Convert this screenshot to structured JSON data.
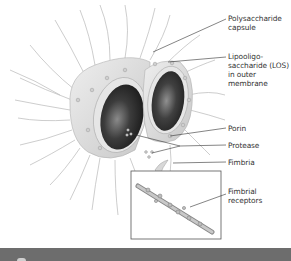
{
  "figure": {
    "labels": [
      {
        "id": "polysaccharide-capsule",
        "text": "Polysaccharide\ncapsule",
        "x": 228,
        "y": 14
      },
      {
        "id": "lipooligosaccharide",
        "text": "Lipooligo-\nsaccharide (LOS)\nin outer\nmembrane",
        "x": 228,
        "y": 52
      },
      {
        "id": "porin",
        "text": "Porin",
        "x": 228,
        "y": 124
      },
      {
        "id": "protease",
        "text": "Protease",
        "x": 228,
        "y": 141
      },
      {
        "id": "fimbria",
        "text": "Fimbria",
        "x": 228,
        "y": 158
      },
      {
        "id": "fimbrial-receptors",
        "text": "Fimbrial\nreceptors",
        "x": 228,
        "y": 187
      }
    ]
  },
  "colors": {
    "cell_surface": "#dcdcdc",
    "cell_interior": "#3a3a3a",
    "leader_line": "#333333",
    "bottom_bar": "#6d6d6d"
  }
}
